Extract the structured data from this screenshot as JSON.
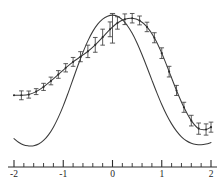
{
  "figure": {
    "background_color": "#ffffff",
    "ink_color": "#2b2b2b",
    "width_px": 221,
    "height_px": 188
  },
  "chart_data": {
    "type": "line",
    "title": "",
    "subtitle": "",
    "xlabel": "",
    "ylabel": "",
    "xlim": [
      -2.0,
      2.0
    ],
    "ylim": [
      0.0,
      1.0
    ],
    "grid": false,
    "legend": false,
    "legend_position": "none",
    "x_axis": {
      "visible": true,
      "position": "bottom",
      "major_ticks": [
        -2,
        -1,
        0,
        1,
        2
      ],
      "major_tick_labels": [
        "-2",
        "-1",
        "0",
        "1",
        "2"
      ],
      "minor_tick_interval": 0.2,
      "tick_direction": "up",
      "major_tick_length_px": 7,
      "minor_tick_length_px": 4
    },
    "y_axis": {
      "visible": false,
      "ticks": [],
      "tick_labels": []
    },
    "series": [
      {
        "name": "theoretical-curve",
        "style": "smooth-line",
        "markers": false,
        "error_bars": "single",
        "description": "Symmetric bell-shaped curve peaking at x = 0, with a shallow local minimum near x = -1.65 and a shallow local minimum near x = 1.8.",
        "x": [
          -2.0,
          -1.9,
          -1.8,
          -1.7,
          -1.65,
          -1.6,
          -1.5,
          -1.4,
          -1.3,
          -1.2,
          -1.1,
          -1.0,
          -0.9,
          -0.8,
          -0.7,
          -0.6,
          -0.5,
          -0.4,
          -0.3,
          -0.2,
          -0.1,
          0.0,
          0.1,
          0.2,
          0.3,
          0.4,
          0.5,
          0.6,
          0.7,
          0.8,
          0.9,
          1.0,
          1.1,
          1.2,
          1.3,
          1.4,
          1.5,
          1.6,
          1.7,
          1.8,
          1.9,
          2.0
        ],
        "y": [
          0.145,
          0.118,
          0.101,
          0.095,
          0.094,
          0.096,
          0.108,
          0.132,
          0.17,
          0.222,
          0.288,
          0.366,
          0.454,
          0.547,
          0.64,
          0.727,
          0.805,
          0.869,
          0.918,
          0.952,
          0.972,
          0.979,
          0.971,
          0.948,
          0.909,
          0.856,
          0.789,
          0.711,
          0.627,
          0.54,
          0.455,
          0.375,
          0.304,
          0.244,
          0.195,
          0.157,
          0.13,
          0.113,
          0.105,
          0.103,
          0.108,
          0.118
        ]
      },
      {
        "name": "measured-curve",
        "style": "smooth-line",
        "markers": true,
        "error_bars": "all-points",
        "description": "Asymmetric curve with measured points and vertical error bars; elevated plateau on the left, peak near x = 0.4, shallow minimum near x = 1.7.",
        "x": [
          -2.0,
          -1.85,
          -1.7,
          -1.55,
          -1.4,
          -1.25,
          -1.1,
          -0.95,
          -0.8,
          -0.65,
          -0.5,
          -0.35,
          -0.2,
          -0.05,
          0.1,
          0.25,
          0.4,
          0.55,
          0.7,
          0.85,
          1.0,
          1.15,
          1.3,
          1.45,
          1.6,
          1.75,
          1.9,
          2.0
        ],
        "y": [
          0.438,
          0.437,
          0.442,
          0.462,
          0.494,
          0.534,
          0.578,
          0.623,
          0.663,
          0.698,
          0.734,
          0.778,
          0.83,
          0.883,
          0.926,
          0.951,
          0.958,
          0.943,
          0.899,
          0.826,
          0.722,
          0.597,
          0.47,
          0.356,
          0.266,
          0.212,
          0.206,
          0.222
        ],
        "yerr": [
          0.0,
          0.03,
          0.024,
          0.02,
          0.024,
          0.026,
          0.026,
          0.028,
          0.03,
          0.034,
          0.042,
          0.05,
          0.054,
          0.05,
          0.042,
          0.036,
          0.032,
          0.03,
          0.032,
          0.034,
          0.036,
          0.036,
          0.034,
          0.034,
          0.036,
          0.038,
          0.038,
          0.034
        ]
      }
    ],
    "annotations": [
      {
        "name": "peak-error-bar",
        "x": 0.0,
        "y": 0.84,
        "yerr_low": 0.79,
        "yerr_high": 0.99,
        "description": "Tall vertical error bar drawn at x = 0 on the theoretical curve peak."
      }
    ]
  }
}
